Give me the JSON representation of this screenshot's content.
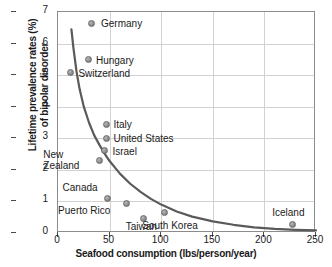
{
  "chart_data": {
    "type": "scatter",
    "title": "",
    "xlabel": "Seafood consumption (lbs/person/year)",
    "ylabel_line1": "Lifetime prevalence rates (%)",
    "ylabel_line2": "of bipolar disorder",
    "xlim": [
      0,
      250
    ],
    "ylim": [
      0,
      7
    ],
    "xticks": [
      0,
      50,
      100,
      150,
      200,
      250
    ],
    "yticks": [
      0,
      1,
      2,
      3,
      4,
      5,
      6,
      7
    ],
    "grid": true,
    "legend": "none",
    "marker_color": "#8f8f8f",
    "curve_color": "#5a5a5a",
    "grid_color": "#d2d2d2",
    "axis_color": "#8c8c8c",
    "points": [
      {
        "label": "Germany",
        "x": 32,
        "y": 6.65,
        "label_dx": 10,
        "label_dy": -5,
        "lines": [
          "Germany"
        ]
      },
      {
        "label": "Hungary",
        "x": 30,
        "y": 5.48,
        "label_dx": 7,
        "label_dy": -5,
        "lines": [
          "Hungary"
        ]
      },
      {
        "label": "Switzerland",
        "x": 12,
        "y": 5.08,
        "label_dx": 8,
        "label_dy": -5,
        "lines": [
          "Switzerland"
        ]
      },
      {
        "label": "Italy",
        "x": 47,
        "y": 3.45,
        "label_dx": 7,
        "label_dy": -5,
        "lines": [
          "Italy"
        ]
      },
      {
        "label": "United States",
        "x": 47,
        "y": 3.0,
        "label_dx": 7,
        "label_dy": -5,
        "lines": [
          "United States"
        ]
      },
      {
        "label": "Israel",
        "x": 45,
        "y": 2.6,
        "label_dx": 8,
        "label_dy": -5,
        "lines": [
          "Israel"
        ]
      },
      {
        "label": "New Zealand",
        "x": 40,
        "y": 2.31,
        "label_dx": -56,
        "label_dy": -11,
        "lines": [
          "New",
          "Zealand"
        ]
      },
      {
        "label": "Canada",
        "x": 48,
        "y": 1.1,
        "label_dx": -45,
        "label_dy": -16,
        "lines": [
          "Canada"
        ]
      },
      {
        "label": "Puerto Rico",
        "x": 66,
        "y": 0.92,
        "label_dx": -68,
        "label_dy": 1,
        "lines": [
          "Puerto Rico"
        ]
      },
      {
        "label": "Taiwan",
        "x": 83,
        "y": 0.46,
        "label_dx": -18,
        "label_dy": 3,
        "lines": [
          "Taiwan"
        ]
      },
      {
        "label": "South Korea",
        "x": 103,
        "y": 0.64,
        "label_dx": -22,
        "label_dy": 7,
        "lines": [
          "South Korea"
        ]
      },
      {
        "label": "Iceland",
        "x": 227,
        "y": 0.28,
        "label_dx": -20,
        "label_dy": -17,
        "lines": [
          "Iceland"
        ]
      }
    ],
    "trend_curve": {
      "description": "exponential decay fit",
      "points": [
        [
          13,
          6.45
        ],
        [
          15,
          5.85
        ],
        [
          18,
          5.1
        ],
        [
          21,
          4.55
        ],
        [
          25,
          4.0
        ],
        [
          30,
          3.5
        ],
        [
          35,
          3.1
        ],
        [
          40,
          2.8
        ],
        [
          45,
          2.52
        ],
        [
          50,
          2.28
        ],
        [
          60,
          1.88
        ],
        [
          70,
          1.56
        ],
        [
          80,
          1.3
        ],
        [
          90,
          1.08
        ],
        [
          100,
          0.9
        ],
        [
          115,
          0.68
        ],
        [
          130,
          0.52
        ],
        [
          150,
          0.37
        ],
        [
          170,
          0.26
        ],
        [
          190,
          0.18
        ],
        [
          210,
          0.13
        ],
        [
          230,
          0.1
        ],
        [
          250,
          0.08
        ]
      ]
    }
  }
}
